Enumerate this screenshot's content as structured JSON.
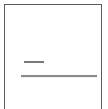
{
  "panel": {
    "name": "bordered-content-panel",
    "border_color": "#5c5c5c",
    "background_color": "#ffffff",
    "border_width_px": 1,
    "inset_left_px": 4,
    "inset_top_px": 4,
    "inner_width_px": 96,
    "bottom_edge_clipped": "true"
  },
  "content": {
    "blank_upper_region_label": "",
    "rules": [
      {
        "name": "short-rule",
        "label": "",
        "color": "#787878",
        "x_px": 24,
        "y_px": 61,
        "width_px": 20,
        "height_px": 2
      },
      {
        "name": "long-rule",
        "label": "",
        "color": "#8a8a8a",
        "x_px": 21,
        "y_px": 75,
        "width_px": 76,
        "height_px": 2
      }
    ]
  },
  "canvas": {
    "width_px": 108,
    "height_px": 109,
    "background_color": "#ffffff"
  }
}
